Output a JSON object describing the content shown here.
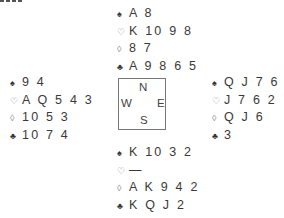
{
  "deal": {
    "north": {
      "spades": {
        "symbol": "♠",
        "cards": "A 8"
      },
      "hearts": {
        "symbol": "♡",
        "cards": "K 10 9 8"
      },
      "diamonds": {
        "symbol": "◊",
        "cards": "8 7"
      },
      "clubs": {
        "symbol": "♣",
        "cards": "A 9 8 6 5"
      }
    },
    "west": {
      "spades": {
        "symbol": "♠",
        "cards": "9 4"
      },
      "hearts": {
        "symbol": "♡",
        "cards": "A Q 5 4 3"
      },
      "diamonds": {
        "symbol": "◊",
        "cards": "10 5 3"
      },
      "clubs": {
        "symbol": "♣",
        "cards": "10 7 4"
      }
    },
    "east": {
      "spades": {
        "symbol": "♠",
        "cards": "Q J 7 6 5"
      },
      "hearts": {
        "symbol": "♡",
        "cards": "J 7 6 2"
      },
      "diamonds": {
        "symbol": "◊",
        "cards": "Q J 6"
      },
      "clubs": {
        "symbol": "♣",
        "cards": "3"
      }
    },
    "south": {
      "spades": {
        "symbol": "♠",
        "cards": "K 10 3 2"
      },
      "hearts": {
        "symbol": "♡",
        "cards": "—"
      },
      "diamonds": {
        "symbol": "◊",
        "cards": "A K 9 4 2"
      },
      "clubs": {
        "symbol": "♣",
        "cards": "K Q J 2"
      }
    }
  },
  "compass": {
    "north": "N",
    "south": "S",
    "west": "W",
    "east": "E"
  },
  "colors": {
    "black_suit": "#333333",
    "red_suit_outline": "#888888",
    "box_border": "#777777"
  }
}
